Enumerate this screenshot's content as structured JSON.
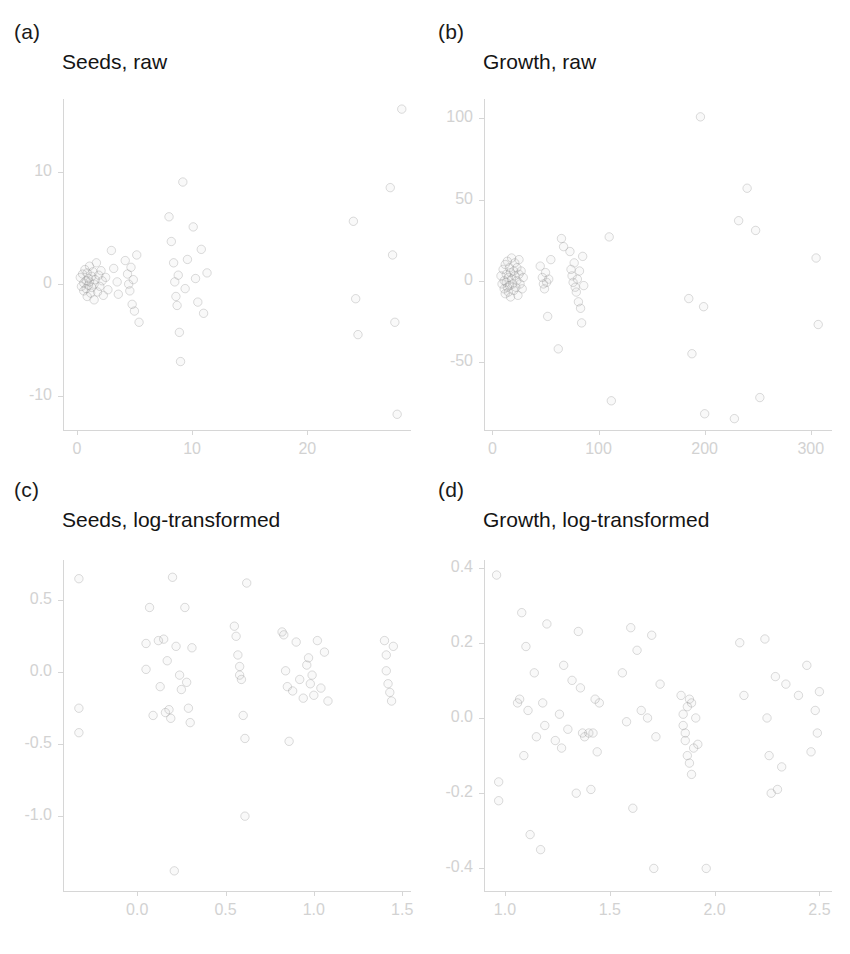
{
  "figure": {
    "width": 850,
    "height": 954,
    "background": "#ffffff",
    "point_color": "#969696",
    "axis_color": "#d6d6d6",
    "tick_label_color": "#d2d2d2",
    "title_color": "#141414"
  },
  "panels": [
    {
      "key": "a",
      "label": "(a)",
      "title": "Seeds, raw",
      "chart_data": {
        "type": "scatter",
        "title": "Seeds, raw",
        "xlabel": "",
        "ylabel": "",
        "grid": false,
        "legend": false,
        "xlim": [
          -1.2,
          29.0
        ],
        "ylim": [
          -13.0,
          16.5
        ],
        "xticks": [
          0,
          10,
          20
        ],
        "xtick_labels": [
          "0",
          "10",
          "20"
        ],
        "yticks": [
          10,
          0,
          -10
        ],
        "ytick_labels": [
          "10",
          "0",
          "-10"
        ],
        "points": [
          [
            0.3,
            0.6
          ],
          [
            0.4,
            -0.2
          ],
          [
            0.5,
            0.9
          ],
          [
            0.6,
            0.1
          ],
          [
            0.6,
            -0.6
          ],
          [
            0.7,
            1.3
          ],
          [
            0.8,
            0.3
          ],
          [
            0.8,
            -0.4
          ],
          [
            0.9,
            1.0
          ],
          [
            0.9,
            -1.1
          ],
          [
            1.0,
            0.5
          ],
          [
            1.0,
            -0.1
          ],
          [
            1.1,
            1.6
          ],
          [
            1.1,
            0.2
          ],
          [
            1.2,
            -0.8
          ],
          [
            1.3,
            0.7
          ],
          [
            1.3,
            -0.3
          ],
          [
            1.4,
            1.1
          ],
          [
            1.5,
            0.0
          ],
          [
            1.5,
            -1.4
          ],
          [
            1.6,
            0.4
          ],
          [
            1.7,
            1.9
          ],
          [
            1.8,
            -0.7
          ],
          [
            1.9,
            0.8
          ],
          [
            2.0,
            -0.2
          ],
          [
            2.1,
            1.2
          ],
          [
            2.2,
            0.3
          ],
          [
            2.3,
            -1.0
          ],
          [
            2.5,
            0.6
          ],
          [
            2.7,
            -0.5
          ],
          [
            3.0,
            3.0
          ],
          [
            3.2,
            1.4
          ],
          [
            3.5,
            0.2
          ],
          [
            3.6,
            -0.9
          ],
          [
            4.2,
            2.1
          ],
          [
            4.4,
            0.9
          ],
          [
            4.5,
            0.0
          ],
          [
            4.6,
            -0.6
          ],
          [
            4.7,
            1.5
          ],
          [
            4.8,
            -1.8
          ],
          [
            4.9,
            0.4
          ],
          [
            5.0,
            -2.4
          ],
          [
            5.2,
            2.6
          ],
          [
            5.4,
            -3.4
          ],
          [
            8.0,
            6.0
          ],
          [
            8.2,
            3.8
          ],
          [
            8.4,
            1.9
          ],
          [
            8.5,
            0.2
          ],
          [
            8.6,
            -1.1
          ],
          [
            8.7,
            -1.9
          ],
          [
            8.8,
            0.8
          ],
          [
            8.9,
            -4.3
          ],
          [
            9.0,
            -6.9
          ],
          [
            9.2,
            9.1
          ],
          [
            9.4,
            -0.4
          ],
          [
            9.6,
            2.2
          ],
          [
            10.1,
            5.1
          ],
          [
            10.3,
            0.5
          ],
          [
            10.5,
            -1.6
          ],
          [
            10.8,
            3.1
          ],
          [
            11.0,
            -2.6
          ],
          [
            11.3,
            1.0
          ],
          [
            24.0,
            5.6
          ],
          [
            24.2,
            -1.3
          ],
          [
            24.4,
            -4.5
          ],
          [
            27.2,
            8.6
          ],
          [
            27.4,
            2.6
          ],
          [
            27.6,
            -3.4
          ],
          [
            27.8,
            -11.6
          ],
          [
            28.2,
            15.6
          ]
        ]
      }
    },
    {
      "key": "b",
      "label": "(b)",
      "title": "Growth, raw",
      "chart_data": {
        "type": "scatter",
        "title": "Growth, raw",
        "xlabel": "",
        "ylabel": "",
        "grid": false,
        "legend": false,
        "xlim": [
          -8,
          320
        ],
        "ylim": [
          -92,
          112
        ],
        "xticks": [
          0,
          100,
          200,
          300
        ],
        "xtick_labels": [
          "0",
          "100",
          "200",
          "300"
        ],
        "yticks": [
          100,
          50,
          0,
          -50
        ],
        "ytick_labels": [
          "100",
          "50",
          "0",
          "-50"
        ],
        "points": [
          [
            8,
            3
          ],
          [
            9,
            -2
          ],
          [
            10,
            7
          ],
          [
            11,
            0
          ],
          [
            11,
            -5
          ],
          [
            12,
            10
          ],
          [
            12,
            -8
          ],
          [
            13,
            4
          ],
          [
            13,
            -1
          ],
          [
            14,
            12
          ],
          [
            14,
            -4
          ],
          [
            15,
            2
          ],
          [
            15,
            -7
          ],
          [
            16,
            8
          ],
          [
            16,
            -3
          ],
          [
            17,
            5
          ],
          [
            17,
            -10
          ],
          [
            18,
            1
          ],
          [
            18,
            14
          ],
          [
            19,
            -2
          ],
          [
            20,
            6
          ],
          [
            20,
            -6
          ],
          [
            21,
            3
          ],
          [
            21,
            11
          ],
          [
            22,
            -4
          ],
          [
            23,
            0
          ],
          [
            23,
            8
          ],
          [
            24,
            -9
          ],
          [
            25,
            4
          ],
          [
            25,
            13
          ],
          [
            26,
            -2
          ],
          [
            27,
            6
          ],
          [
            28,
            -5
          ],
          [
            29,
            2
          ],
          [
            45,
            9
          ],
          [
            47,
            2
          ],
          [
            48,
            -2
          ],
          [
            49,
            -5
          ],
          [
            50,
            5
          ],
          [
            51,
            -1
          ],
          [
            52,
            -22
          ],
          [
            53,
            1
          ],
          [
            55,
            13
          ],
          [
            62,
            -42
          ],
          [
            65,
            26
          ],
          [
            67,
            21
          ],
          [
            73,
            18
          ],
          [
            74,
            7
          ],
          [
            75,
            3
          ],
          [
            76,
            -1
          ],
          [
            77,
            11
          ],
          [
            78,
            -4
          ],
          [
            79,
            -7
          ],
          [
            80,
            1
          ],
          [
            81,
            -13
          ],
          [
            82,
            6
          ],
          [
            83,
            -17
          ],
          [
            84,
            -26
          ],
          [
            85,
            15
          ],
          [
            86,
            -3
          ],
          [
            110,
            27
          ],
          [
            112,
            -74
          ],
          [
            185,
            -11
          ],
          [
            188,
            -45
          ],
          [
            196,
            101
          ],
          [
            199,
            -16
          ],
          [
            200,
            -82
          ],
          [
            228,
            -85
          ],
          [
            232,
            37
          ],
          [
            240,
            57
          ],
          [
            248,
            31
          ],
          [
            252,
            -72
          ],
          [
            305,
            14
          ],
          [
            307,
            -27
          ]
        ]
      }
    },
    {
      "key": "c",
      "label": "(c)",
      "title": "Seeds, log-transformed",
      "chart_data": {
        "type": "scatter",
        "title": "Seeds, log-transformed",
        "xlabel": "",
        "ylabel": "",
        "grid": false,
        "legend": false,
        "xlim": [
          -0.42,
          1.55
        ],
        "ylim": [
          -1.52,
          0.78
        ],
        "xticks": [
          0.0,
          0.5,
          1.0,
          1.5
        ],
        "xtick_labels": [
          "0.0",
          "0.5",
          "1.0",
          "1.5"
        ],
        "yticks": [
          0.5,
          0.0,
          -0.5,
          -1.0
        ],
        "ytick_labels": [
          "0.5",
          "0.0",
          "-0.5",
          "-1.0"
        ],
        "points": [
          [
            -0.33,
            0.65
          ],
          [
            -0.33,
            -0.25
          ],
          [
            -0.33,
            -0.42
          ],
          [
            0.05,
            0.2
          ],
          [
            0.05,
            0.02
          ],
          [
            0.07,
            0.45
          ],
          [
            0.09,
            -0.3
          ],
          [
            0.12,
            0.22
          ],
          [
            0.13,
            -0.1
          ],
          [
            0.15,
            0.23
          ],
          [
            0.16,
            -0.28
          ],
          [
            0.17,
            0.08
          ],
          [
            0.18,
            -0.26
          ],
          [
            0.19,
            -0.32
          ],
          [
            0.2,
            0.66
          ],
          [
            0.21,
            -1.38
          ],
          [
            0.22,
            0.18
          ],
          [
            0.24,
            -0.02
          ],
          [
            0.25,
            -0.12
          ],
          [
            0.27,
            0.45
          ],
          [
            0.28,
            -0.07
          ],
          [
            0.29,
            -0.25
          ],
          [
            0.3,
            -0.35
          ],
          [
            0.31,
            0.17
          ],
          [
            0.55,
            0.32
          ],
          [
            0.56,
            0.25
          ],
          [
            0.57,
            0.12
          ],
          [
            0.58,
            0.04
          ],
          [
            0.58,
            -0.02
          ],
          [
            0.59,
            -0.05
          ],
          [
            0.6,
            -0.3
          ],
          [
            0.61,
            -0.46
          ],
          [
            0.61,
            -1.0
          ],
          [
            0.62,
            0.62
          ],
          [
            0.82,
            0.28
          ],
          [
            0.83,
            0.26
          ],
          [
            0.84,
            0.01
          ],
          [
            0.85,
            -0.1
          ],
          [
            0.86,
            -0.48
          ],
          [
            0.88,
            -0.13
          ],
          [
            0.9,
            0.21
          ],
          [
            0.92,
            -0.05
          ],
          [
            0.94,
            -0.18
          ],
          [
            0.96,
            0.05
          ],
          [
            0.97,
            0.1
          ],
          [
            0.98,
            -0.08
          ],
          [
            0.99,
            -0.02
          ],
          [
            1.0,
            -0.16
          ],
          [
            1.02,
            0.22
          ],
          [
            1.04,
            -0.11
          ],
          [
            1.06,
            0.14
          ],
          [
            1.08,
            -0.2
          ],
          [
            1.4,
            0.22
          ],
          [
            1.41,
            0.12
          ],
          [
            1.41,
            0.01
          ],
          [
            1.42,
            -0.08
          ],
          [
            1.43,
            -0.14
          ],
          [
            1.44,
            -0.2
          ],
          [
            1.45,
            0.18
          ]
        ]
      }
    },
    {
      "key": "d",
      "label": "(d)",
      "title": "Growth, log-transformed",
      "chart_data": {
        "type": "scatter",
        "title": "Growth, log-transformed",
        "xlabel": "",
        "ylabel": "",
        "grid": false,
        "legend": false,
        "xlim": [
          0.9,
          2.56
        ],
        "ylim": [
          -0.46,
          0.42
        ],
        "xticks": [
          1.0,
          1.5,
          2.0,
          2.5
        ],
        "xtick_labels": [
          "1.0",
          "1.5",
          "2.0",
          "2.5"
        ],
        "yticks": [
          0.4,
          0.2,
          0.0,
          -0.2,
          -0.4
        ],
        "ytick_labels": [
          "0.4",
          "0.2",
          "0.0",
          "-0.2",
          "-0.4"
        ],
        "points": [
          [
            0.96,
            0.38
          ],
          [
            0.97,
            -0.17
          ],
          [
            0.97,
            -0.22
          ],
          [
            1.06,
            0.04
          ],
          [
            1.07,
            0.05
          ],
          [
            1.08,
            0.28
          ],
          [
            1.09,
            -0.1
          ],
          [
            1.1,
            0.19
          ],
          [
            1.11,
            0.02
          ],
          [
            1.12,
            -0.31
          ],
          [
            1.14,
            0.12
          ],
          [
            1.15,
            -0.05
          ],
          [
            1.17,
            -0.35
          ],
          [
            1.18,
            0.04
          ],
          [
            1.19,
            -0.02
          ],
          [
            1.2,
            0.25
          ],
          [
            1.24,
            -0.06
          ],
          [
            1.26,
            0.01
          ],
          [
            1.27,
            -0.08
          ],
          [
            1.28,
            0.14
          ],
          [
            1.3,
            -0.03
          ],
          [
            1.32,
            0.1
          ],
          [
            1.34,
            -0.2
          ],
          [
            1.35,
            0.23
          ],
          [
            1.36,
            0.08
          ],
          [
            1.37,
            -0.04
          ],
          [
            1.38,
            -0.05
          ],
          [
            1.4,
            -0.04
          ],
          [
            1.41,
            -0.19
          ],
          [
            1.42,
            -0.04
          ],
          [
            1.43,
            0.05
          ],
          [
            1.44,
            -0.09
          ],
          [
            1.45,
            0.04
          ],
          [
            1.56,
            0.12
          ],
          [
            1.58,
            -0.01
          ],
          [
            1.6,
            0.24
          ],
          [
            1.61,
            -0.24
          ],
          [
            1.63,
            0.18
          ],
          [
            1.65,
            0.02
          ],
          [
            1.68,
            0.0
          ],
          [
            1.7,
            0.22
          ],
          [
            1.71,
            -0.4
          ],
          [
            1.72,
            -0.05
          ],
          [
            1.74,
            0.09
          ],
          [
            1.84,
            0.06
          ],
          [
            1.85,
            0.01
          ],
          [
            1.85,
            -0.02
          ],
          [
            1.86,
            -0.04
          ],
          [
            1.86,
            -0.06
          ],
          [
            1.87,
            -0.1
          ],
          [
            1.87,
            0.03
          ],
          [
            1.88,
            0.05
          ],
          [
            1.88,
            -0.12
          ],
          [
            1.89,
            -0.15
          ],
          [
            1.89,
            0.04
          ],
          [
            1.9,
            -0.08
          ],
          [
            1.91,
            0.0
          ],
          [
            1.92,
            -0.07
          ],
          [
            1.96,
            -0.4
          ],
          [
            2.12,
            0.2
          ],
          [
            2.14,
            0.06
          ],
          [
            2.24,
            0.21
          ],
          [
            2.25,
            0.0
          ],
          [
            2.26,
            -0.1
          ],
          [
            2.27,
            -0.2
          ],
          [
            2.29,
            0.11
          ],
          [
            2.3,
            -0.19
          ],
          [
            2.32,
            -0.13
          ],
          [
            2.34,
            0.09
          ],
          [
            2.4,
            0.06
          ],
          [
            2.44,
            0.14
          ],
          [
            2.46,
            -0.09
          ],
          [
            2.48,
            0.02
          ],
          [
            2.49,
            -0.04
          ],
          [
            2.5,
            0.07
          ]
        ]
      }
    }
  ]
}
